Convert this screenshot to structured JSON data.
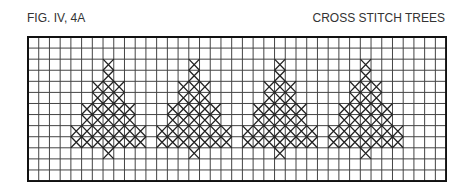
{
  "figure": {
    "label": "FIG. IV, 4A",
    "title": "CROSS STITCH TREES"
  },
  "grid": {
    "columns": 39,
    "rows": 13,
    "cell_width": 10.72,
    "cell_height": 11.08,
    "line_color": "#444444",
    "border_color": "#111111",
    "stitch_color": "#222222"
  },
  "tree_pattern": {
    "description": "Each tree: rows listed as [row_index, half_width] relative to tree center column",
    "rows": [
      [
        2,
        0
      ],
      [
        3,
        0
      ],
      [
        4,
        1
      ],
      [
        5,
        1
      ],
      [
        6,
        2
      ],
      [
        7,
        2
      ],
      [
        8,
        3
      ],
      [
        9,
        3
      ],
      [
        10,
        0
      ]
    ]
  },
  "trees": [
    {
      "name": "tree-1",
      "center_col": 7
    },
    {
      "name": "tree-2",
      "center_col": 15
    },
    {
      "name": "tree-3",
      "center_col": 23
    },
    {
      "name": "tree-4",
      "center_col": 31
    }
  ]
}
